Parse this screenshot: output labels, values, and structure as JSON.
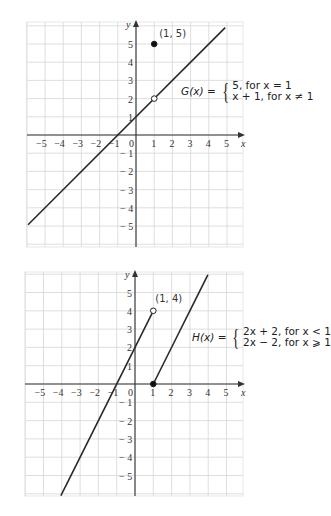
{
  "chart_data": [
    {
      "type": "line",
      "title": "",
      "xlabel": "x",
      "ylabel": "y",
      "xlim": [
        -6,
        5.8
      ],
      "ylim": [
        -6.1,
        6.2
      ],
      "grid": true,
      "x_ticks": [
        -5,
        -4,
        -3,
        -2,
        -1,
        0,
        1,
        2,
        3,
        4,
        5
      ],
      "y_ticks": [
        5,
        4,
        3,
        2,
        1,
        -1,
        -2,
        -3,
        -4,
        -5
      ],
      "function_label": "G(x) =",
      "cases": [
        "5, for x  =  1",
        "x + 1, for x ≠ 1"
      ],
      "series": [
        {
          "name": "y = x + 1",
          "x": [
            -5.93,
            4.9
          ],
          "y": [
            -4.93,
            5.9
          ]
        }
      ],
      "points": [
        {
          "x": 1,
          "y": 5,
          "style": "closed",
          "label": "(1, 5)"
        },
        {
          "x": 1,
          "y": 2,
          "style": "open",
          "label": ""
        }
      ]
    },
    {
      "type": "line",
      "title": "",
      "xlabel": "x",
      "ylabel": "y",
      "xlim": [
        -6.05,
        5.8
      ],
      "ylim": [
        -6.05,
        6.05
      ],
      "grid": true,
      "x_ticks": [
        -5,
        -4,
        -3,
        -2,
        -1,
        0,
        1,
        2,
        3,
        4,
        5
      ],
      "y_ticks": [
        5,
        4,
        3,
        2,
        1,
        -1,
        -2,
        -3,
        -4,
        -5
      ],
      "function_label": "H(x) =",
      "cases": [
        "2x  +  2, for x  <  1",
        "2x  −  2, for x  ⩾  1"
      ],
      "series": [
        {
          "name": "y = 2x + 2 (x < 1)",
          "x": [
            -4.05,
            1
          ],
          "y": [
            -6.1,
            4
          ]
        },
        {
          "name": "y = 2x − 2 (x ≥ 1)",
          "x": [
            1,
            3.98
          ],
          "y": [
            0,
            5.96
          ]
        }
      ],
      "points": [
        {
          "x": 1,
          "y": 4,
          "style": "open",
          "label": "(1, 4)"
        },
        {
          "x": 1,
          "y": 0,
          "style": "closed",
          "label": ""
        }
      ]
    }
  ],
  "graphs": [
    {
      "formula": {
        "fname": "G(x) =",
        "case1": "5, for x  =  1",
        "case2": "x + 1, for x ≠ 1"
      },
      "point_label": "(1, 5)",
      "axis_x": "x",
      "axis_y": "y"
    },
    {
      "formula": {
        "fname": "H(x) =",
        "case1": "2x  +  2, for x  <  1",
        "case2": "2x  −  2, for x  ⩾  1"
      },
      "point_label": "(1, 4)",
      "axis_x": "x",
      "axis_y": "y"
    }
  ],
  "colors": {
    "grid": "#d6d6d6",
    "axis": "#333333",
    "curve": "#2a2a2a",
    "background": "#ffffff"
  }
}
